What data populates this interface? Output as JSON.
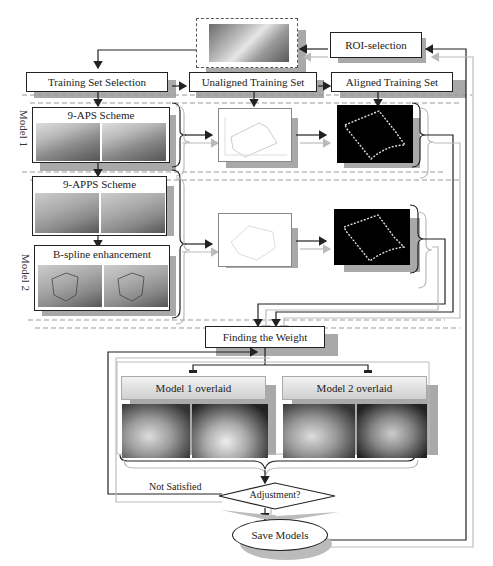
{
  "diagram": {
    "top_image": {
      "label": "ROI image (cervical x-ray crop)"
    },
    "nodes": {
      "roi_selection": "ROI-selection",
      "training_set_selection": "Training Set Selection",
      "unaligned_training_set": "Unaligned Training Set",
      "aligned_training_set": "Aligned Training Set",
      "scheme_9aps": "9-APS  Scheme",
      "scheme_9apps": "9-APPS Scheme",
      "bspline": "B-spline enhancement",
      "finding_weight": "Finding the Weight",
      "model1_overlaid": "Model 1 overlaid",
      "model2_overlaid": "Model 2 overlaid",
      "adjustment": "Adjustment?",
      "save_models": "Save Models",
      "not_satisfied": "Not Satisfied"
    },
    "side_labels": {
      "model1": "Model 1",
      "model2": "Model 2"
    },
    "colors": {
      "line_dark": "#222222",
      "line_light": "#bbbbbb",
      "shadow": "#a9a9a9",
      "dashed": "#999999"
    }
  }
}
